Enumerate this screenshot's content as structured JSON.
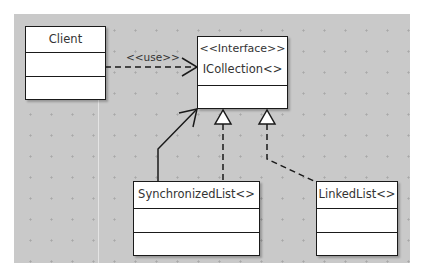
{
  "diagram": {
    "type": "UML class diagram",
    "colors": {
      "canvas": "#c9c9c9",
      "box_fill": "#ffffff",
      "line": "#1a1a1a",
      "text": "#333333"
    },
    "classes": [
      {
        "id": "client",
        "name": "Client",
        "stereotype": null,
        "compartments": 3
      },
      {
        "id": "icollection",
        "stereotype": "<<Interface>>",
        "name": "ICollection<>",
        "compartments": 2
      },
      {
        "id": "synchronizedlist",
        "name": "SynchronizedList<>",
        "stereotype": null,
        "compartments": 3
      },
      {
        "id": "linkedlist",
        "name": "LinkedList<>",
        "stereotype": null,
        "compartments": 3
      }
    ],
    "relationships": [
      {
        "from": "Client",
        "to": "ICollection<>",
        "kind": "dependency",
        "style": "dashed, open arrowhead",
        "label": "<<use>>"
      },
      {
        "from": "SynchronizedList<>",
        "to": "ICollection<>",
        "kind": "association",
        "style": "solid, open arrowhead",
        "label": ""
      },
      {
        "from": "SynchronizedList<>",
        "to": "ICollection<>",
        "kind": "realization",
        "style": "dashed, hollow triangle",
        "label": ""
      },
      {
        "from": "LinkedList<>",
        "to": "ICollection<>",
        "kind": "realization",
        "style": "dashed, hollow triangle",
        "label": ""
      }
    ]
  }
}
